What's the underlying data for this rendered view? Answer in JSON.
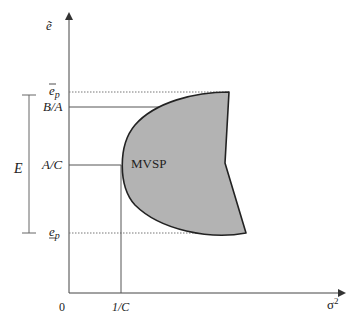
{
  "diagram": {
    "y_axis": {
      "label": "ẽ"
    },
    "x_axis": {
      "label": "σ",
      "label_sup": "2",
      "origin_label": "0",
      "tick_label": "1/C"
    },
    "y_ticks": {
      "e_upper": {
        "base": "e",
        "sub": "p",
        "accent": "overline"
      },
      "b_over_a": "B/A",
      "a_over_c": "A/C",
      "e_lower": {
        "base": "e",
        "sub": "p",
        "accent": "underline"
      }
    },
    "range_bracket": {
      "label": "E"
    },
    "region": {
      "label": "MVSP",
      "fill": "#b3b3b3",
      "stroke": "#222222"
    },
    "colors": {
      "axis": "#444444",
      "guide": "#555555",
      "dotted": "#777777"
    }
  }
}
